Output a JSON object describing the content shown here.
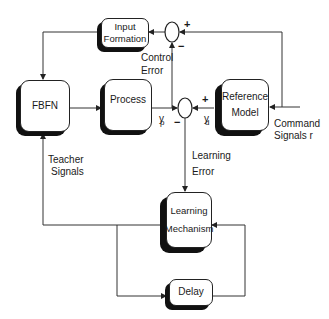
{
  "diagram": {
    "type": "block-diagram",
    "blocks": {
      "input_formation": {
        "line1": "Input",
        "line2": "Formation"
      },
      "fbfn": {
        "label": "FBFN"
      },
      "process": {
        "label": "Process"
      },
      "reference_model": {
        "line1": "Reference",
        "line2": "Model"
      },
      "learning_mechanism": {
        "line1": "Learning",
        "line2": "Mechanism"
      },
      "delay": {
        "label": "Delay"
      }
    },
    "summing_junctions": {
      "control": {
        "plus": "+",
        "minus": "−"
      },
      "learning": {
        "plus": "+",
        "minus": "−"
      }
    },
    "labels": {
      "control_error_1": "Control",
      "control_error_2": "Error",
      "learning_error_1": "Learning",
      "learning_error_2": "Error",
      "teacher_signals_1": "Teacher",
      "teacher_signals_2": "Signals",
      "command_signals_1": "Command",
      "command_signals_2": "Signals r",
      "yp_main": "y",
      "yp_sub": "p",
      "yd_main": "y",
      "yd_sub": "d"
    }
  }
}
